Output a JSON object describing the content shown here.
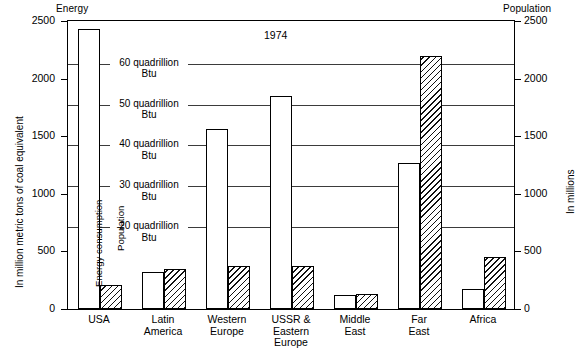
{
  "chart_data": {
    "type": "bar",
    "title": "1974",
    "categories": [
      "USA",
      "Latin\nAmerica",
      "Western\nEurope",
      "USSR &\nEastern\nEurope",
      "Middle\nEast",
      "Far\nEast",
      "Africa"
    ],
    "series": [
      {
        "name": "Energy consumption",
        "unit": "million metric tons of coal equivalent",
        "values": [
          2430,
          320,
          1565,
          1850,
          125,
          1270,
          175
        ],
        "style": "white"
      },
      {
        "name": "Population",
        "unit": "millions",
        "values": [
          212,
          350,
          370,
          370,
          130,
          2200,
          450
        ],
        "style": "hatched"
      }
    ],
    "left_axis": {
      "caption": "Energy",
      "title": "In million metric tons of coal equivalent",
      "ticks": [
        0,
        500,
        1000,
        1500,
        2000,
        2500
      ],
      "ylim": [
        0,
        2500
      ]
    },
    "right_axis": {
      "caption": "Population",
      "title": "In millions",
      "ticks": [
        0,
        500,
        1000,
        1500,
        2000,
        2500
      ],
      "ylim": [
        0,
        2500
      ]
    },
    "gridlines": [
      {
        "value": 2130,
        "label_line1": "60 quadrillion",
        "label_line2": "Btu"
      },
      {
        "value": 1775,
        "label_line1": "50 quadrillion",
        "label_line2": "Btu"
      },
      {
        "value": 1420,
        "label_line1": "40 quadrillion",
        "label_line2": "Btu"
      },
      {
        "value": 1065,
        "label_line1": "30 quadrillion",
        "label_line2": "Btu"
      },
      {
        "value": 710,
        "label_line1": "20 quadrillion",
        "label_line2": "Btu"
      }
    ],
    "inbar_labels": [
      "Energy consumption",
      "Population"
    ],
    "grid": true,
    "legend": "in-bar",
    "colors": {
      "axis": "#000000",
      "grid": "#3b3b3b",
      "energy_fill": "#ffffff",
      "population_hatch": "#111111",
      "background": "#ffffff"
    }
  }
}
